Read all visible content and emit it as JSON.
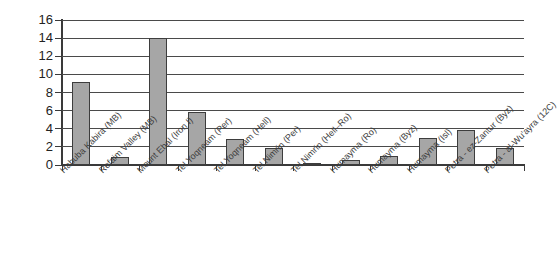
{
  "chart_data": {
    "type": "bar",
    "title": "",
    "subtitle": "",
    "xlabel": "",
    "ylabel": "",
    "ylim": [
      0,
      16
    ],
    "ytick_step": 2,
    "yticks": [
      "0",
      "2",
      "4",
      "6",
      "8",
      "10",
      "12",
      "14",
      "16"
    ],
    "grid": true,
    "legend": false,
    "legend_position": "none",
    "bar_fill_color": "#a6a6a6",
    "bar_border_color": "#3d3d3d",
    "categories": [
      "Habuba Kabira (MB)",
      "Refaim Valley (MB)",
      "Mount Ebal (Iron I)",
      "Tel Yoqneam (Per)",
      "Tel Yoqneam (Hell)",
      "Tel Nimrin (Per)",
      "Tel Nimrin (Hell–Ro)",
      "Humayma (Ro)",
      "Humayma (Byz)",
      "Humayma (Isl)",
      "Petra - ez-Zantur (Byz)",
      "Petra - al-Wu'ayra (12C)"
    ],
    "values": [
      9.2,
      0.9,
      14.0,
      5.9,
      2.9,
      1.9,
      0.15,
      0.5,
      1.0,
      3.0,
      3.9,
      1.9
    ]
  }
}
